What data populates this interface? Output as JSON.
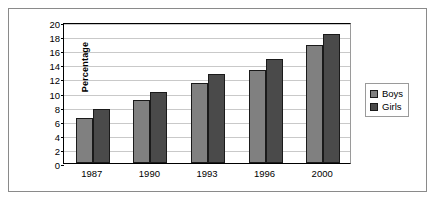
{
  "chart_data": {
    "type": "bar",
    "title": "",
    "subtitle": "",
    "xlabel": "",
    "ylabel": "Percentage",
    "categories": [
      "1987",
      "1990",
      "1993",
      "1996",
      "2000"
    ],
    "series": [
      {
        "name": "Boys",
        "color": "#808080",
        "values": [
          6.4,
          8.9,
          11.4,
          13.2,
          16.7
        ]
      },
      {
        "name": "Girls",
        "color": "#4a4a4a",
        "values": [
          7.6,
          10.1,
          12.6,
          14.8,
          18.3
        ]
      }
    ],
    "ylim": [
      0,
      20
    ],
    "ytick_step": 2,
    "yticks": [
      "0",
      "2",
      "4",
      "6",
      "8",
      "10",
      "12",
      "14",
      "16",
      "18",
      "20"
    ],
    "grid": true,
    "grid_axis": "y",
    "legend_position": "right",
    "legend_entries": [
      "Boys",
      "Girls"
    ]
  },
  "colors": {
    "boys": "#808080",
    "girls": "#4a4a4a",
    "gridline": "#c9c9c9",
    "axis": "#000000",
    "frame_border": "#8a8a8a",
    "background": "#ffffff"
  }
}
